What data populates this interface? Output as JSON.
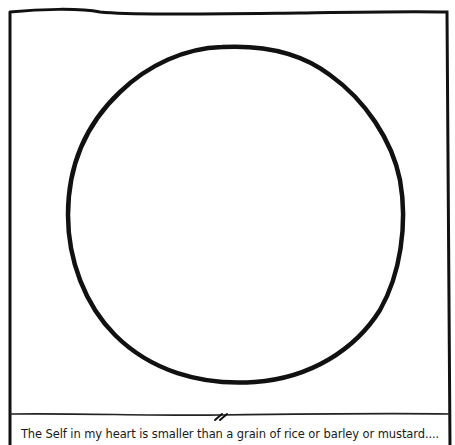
{
  "comic": {
    "caption": "The Self in my heart is smaller than a grain of rice or barley or mustard....",
    "figure": "circle",
    "ink_color": "#111111",
    "background_color": "#ffffff"
  }
}
